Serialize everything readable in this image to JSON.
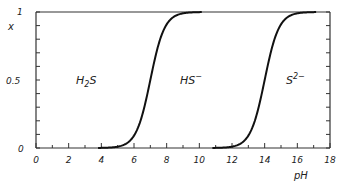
{
  "chart_data": {
    "type": "line",
    "title": "",
    "xlabel": "pH",
    "ylabel": "x",
    "xlim": [
      0,
      18
    ],
    "ylim": [
      0,
      1
    ],
    "grid": false,
    "x_ticks": [
      "0",
      "2",
      "4",
      "6",
      "8",
      "10",
      "12",
      "14",
      "16",
      "18"
    ],
    "x_minor_step": 1,
    "y_ticks": [
      "0",
      "0.5",
      "1"
    ],
    "y_minor_step": 0.1,
    "series": [
      {
        "name": "H2S / HS- boundary",
        "pKa": 7.0,
        "x": [
          4,
          5,
          6,
          6.5,
          7,
          7.5,
          8,
          9,
          10
        ],
        "values": [
          0.001,
          0.01,
          0.09,
          0.24,
          0.5,
          0.76,
          0.91,
          0.99,
          1.0
        ]
      },
      {
        "name": "HS- / S2- boundary",
        "pKa": 14.0,
        "x": [
          11,
          12,
          13,
          13.5,
          14,
          14.5,
          15,
          16,
          17
        ],
        "values": [
          0.001,
          0.01,
          0.09,
          0.24,
          0.5,
          0.76,
          0.91,
          0.99,
          1.0
        ]
      }
    ],
    "annotations": [
      {
        "text": "H2S",
        "x": 3.3,
        "y": 0.5
      },
      {
        "text": "HS⁻",
        "x": 9.8,
        "y": 0.5
      },
      {
        "text": "S²⁻",
        "x": 15.5,
        "y": 0.5
      }
    ]
  },
  "labels": {
    "y_axis": "x",
    "x_axis": "pH",
    "y_top": "1",
    "y_mid": "0.5",
    "y_bottom": "0",
    "species_1_base": "H",
    "species_1_sub": "2",
    "species_1_tail": "S",
    "species_2_base": "HS",
    "species_2_sup": "−",
    "species_3_base": "S",
    "species_3_sup": "2−"
  }
}
